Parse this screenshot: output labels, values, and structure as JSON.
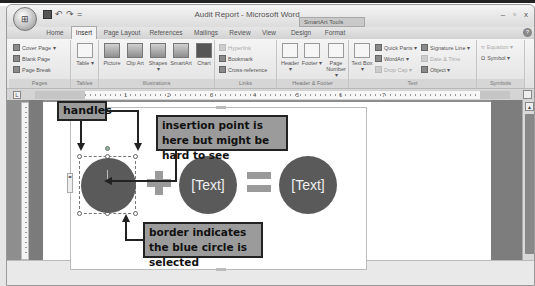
{
  "window": {
    "title": "Audit Report - Microsoft Word",
    "context_tool_label": "SmartArt Tools",
    "controls": [
      "minimize",
      "maximize",
      "close"
    ],
    "controls_glyphs": [
      "–",
      "▫",
      "x"
    ]
  },
  "quick_access": {
    "office_button_glyph": "⊞",
    "items": [
      "save",
      "undo",
      "redo",
      "customize"
    ],
    "glyphs": [
      "",
      "↶",
      "↷",
      "="
    ]
  },
  "tabs": [
    {
      "label": "Home",
      "active": false
    },
    {
      "label": "Insert",
      "active": true
    },
    {
      "label": "Page Layout",
      "active": false
    },
    {
      "label": "References",
      "active": false
    },
    {
      "label": "Mailings",
      "active": false
    },
    {
      "label": "Review",
      "active": false
    },
    {
      "label": "View",
      "active": false
    },
    {
      "label": "Design",
      "active": false
    },
    {
      "label": "Format",
      "active": false
    }
  ],
  "help_glyph": "?",
  "ribbon": {
    "groups": {
      "pages": {
        "label": "Pages",
        "items": [
          "Cover Page ▾",
          "Blank Page",
          "Page Break"
        ]
      },
      "tables": {
        "label": "Tables",
        "items": [
          "Table ▾"
        ]
      },
      "illustrations": {
        "label": "Illustrations",
        "items": [
          "Picture",
          "Clip Art",
          "Shapes ▾",
          "SmartArt",
          "Chart"
        ]
      },
      "links": {
        "label": "Links",
        "items": [
          "Hyperlink",
          "Bookmark",
          "Cross-reference"
        ]
      },
      "header_footer": {
        "label": "Header & Footer",
        "items": [
          "Header ▾",
          "Footer ▾",
          "Page Number ▾"
        ]
      },
      "text": {
        "label": "Text",
        "items": [
          "Text Box ▾",
          "Quick Parts ▾",
          "WordArt ▾",
          "Drop Cap ▾",
          "Signature Line ▾",
          "Date & Time",
          "Object ▾"
        ]
      },
      "symbols": {
        "label": "Symbols",
        "items": [
          "Equation ▾",
          "Symbol ▾"
        ]
      }
    }
  },
  "ruler": {
    "corner_glyph": "L",
    "numbers": [
      "1",
      "2",
      "3",
      "4",
      "5",
      "6",
      "7"
    ]
  },
  "smartart": {
    "circle1_text": "",
    "circle2_text": "[Text]",
    "circle3_text": "[Text]",
    "pane_toggle_glyph": "◂▸"
  },
  "callouts": {
    "handles": "handles",
    "insertion": "insertion point is here but might be hard to see",
    "border": "border indicates the blue circle is selected"
  },
  "scrollbar": {
    "up_glyph": "▲"
  }
}
